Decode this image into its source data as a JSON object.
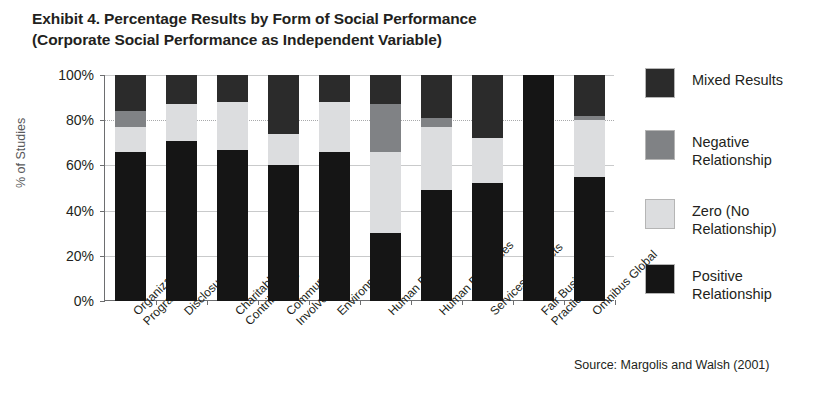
{
  "title": {
    "line1": "Exhibit 4. Percentage Results by Form of Social Performance",
    "line2": "(Corporate Social Performance as Independent Variable)"
  },
  "axes": {
    "y_title": "% of Studies",
    "y_ticks": [
      "100%",
      "80%",
      "60%",
      "40%",
      "20%",
      "0%"
    ]
  },
  "source": "Source: Margolis and Walsh (2001)",
  "legend": {
    "position": "right",
    "items": [
      {
        "label_line1": "Mixed Results",
        "label_line2": "",
        "color": "#2b2b2b",
        "key": "mixed"
      },
      {
        "label_line1": "Negative",
        "label_line2": "Relationship",
        "color": "#808285",
        "key": "negative"
      },
      {
        "label_line1": "Zero (No",
        "label_line2": "Relationship)",
        "color": "#dcdddf",
        "key": "zero"
      },
      {
        "label_line1": "Positive",
        "label_line2": "Relationship",
        "color": "#151515",
        "key": "positive"
      }
    ]
  },
  "chart_data": {
    "type": "bar",
    "subtype": "stacked-percentage-column",
    "title": "Exhibit 4. Percentage Results by Form of Social Performance (Corporate Social Performance as Independent Variable)",
    "xlabel": "",
    "ylabel": "% of Studies",
    "ylim": [
      0,
      100
    ],
    "yticks": [
      0,
      20,
      40,
      60,
      80,
      100
    ],
    "grid": true,
    "legend_position": "right",
    "source": "Source: Margolis and Walsh (2001)",
    "categories": [
      "Organizational Programs",
      "Disclosure",
      "Charitable Contributions",
      "Community Involvement",
      "Environment",
      "Human Rights",
      "Human Resources",
      "Services/Products",
      "Fair Business Practice",
      "Omnibus Global"
    ],
    "category_lines": [
      [
        "Organizational",
        "Programs"
      ],
      [
        "Disclosure"
      ],
      [
        "Charitable",
        "Contributions"
      ],
      [
        "Community",
        "Involvement"
      ],
      [
        "Environment"
      ],
      [
        "Human Rights"
      ],
      [
        "Human Resources"
      ],
      [
        "Services/Products"
      ],
      [
        "Fair Business",
        "Practice"
      ],
      [
        "Omnibus Global"
      ]
    ],
    "series": [
      {
        "name": "Positive Relationship",
        "color": "#151515",
        "values": [
          66,
          71,
          67,
          60,
          66,
          30,
          49,
          52,
          100,
          55
        ]
      },
      {
        "name": "Zero (No Relationship)",
        "color": "#dcdddf",
        "values": [
          11,
          16,
          21,
          14,
          22,
          36,
          28,
          20,
          0,
          25
        ]
      },
      {
        "name": "Negative Relationship",
        "color": "#808285",
        "values": [
          7,
          0,
          0,
          0,
          0,
          21,
          4,
          0,
          0,
          2
        ]
      },
      {
        "name": "Mixed Results",
        "color": "#2b2b2b",
        "values": [
          16,
          13,
          12,
          26,
          12,
          13,
          19,
          28,
          0,
          18
        ]
      }
    ]
  }
}
